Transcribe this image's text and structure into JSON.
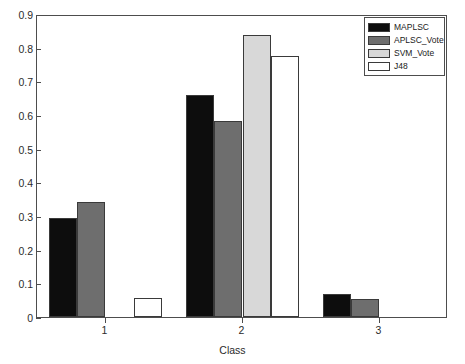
{
  "chart_data": {
    "type": "bar",
    "title": "",
    "xlabel": "Class",
    "ylabel": "",
    "categories": [
      "1",
      "2",
      "3"
    ],
    "series": [
      {
        "name": "MAPLSC",
        "color": "#0d0d0d",
        "values": [
          0.294,
          0.66,
          0.067
        ]
      },
      {
        "name": "APLSC_Vote",
        "color": "#6e6e6e",
        "values": [
          0.343,
          0.583,
          0.053
        ]
      },
      {
        "name": "SVM_Vote",
        "color": "#d8d8d8",
        "values": [
          0.0,
          0.838,
          0.0
        ]
      },
      {
        "name": "J48",
        "color": "#ffffff",
        "values": [
          0.056,
          0.775,
          0.0
        ]
      }
    ],
    "ylim": [
      0,
      0.9
    ],
    "ytick_labels": [
      "0",
      "0.1",
      "0.2",
      "0.3",
      "0.4",
      "0.5",
      "0.6",
      "0.7",
      "0.8",
      "0.9"
    ],
    "ytick_values": [
      0,
      0.1,
      0.2,
      0.3,
      0.4,
      0.5,
      0.6,
      0.7,
      0.8,
      0.9
    ],
    "xtick_labels": [
      "1",
      "2",
      "3"
    ],
    "grid": false,
    "legend_position": "top-right",
    "legend_entries": [
      "MAPLSC",
      "APLSC_Vote",
      "SVM_Vote",
      "J48"
    ]
  }
}
